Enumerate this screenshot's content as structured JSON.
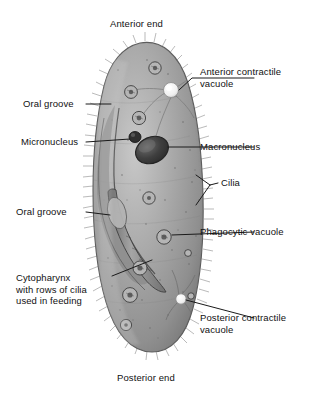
{
  "figure": {
    "organism": "Paramecium",
    "view": "whole-cell light micrograph style illustration",
    "background_color": "#ffffff",
    "body_color": "#9a9a9a",
    "body_highlight_color": "#c3c3c3",
    "body_shadow_color": "#6f6f6f",
    "outline_color": "#4a4a4a",
    "nucleus_color": "#3b3b3b",
    "vacuole_color": "#f4f4f4",
    "leader_color": "#1a1a1a",
    "text_color": "#111111"
  },
  "labels": {
    "anterior_end": "Anterior end",
    "posterior_end": "Posterior end",
    "anterior_contractile_vacuole": "Anterior contractile\nvacuole",
    "macronucleus": "Macronucleus",
    "cilia": "Cilia",
    "phagocytic_vacuole": "Phagocytic vacuole",
    "posterior_contractile_vacuole": "Posterior contractile\nvacuole",
    "oral_groove_upper": "Oral groove",
    "micronucleus": "Micronucleus",
    "oral_groove_lower": "Oral groove",
    "cytopharynx": "Cytopharynx\nwith rows of cilia\nused in feeding"
  },
  "structures": [
    {
      "name": "anterior contractile vacuole",
      "side": "right",
      "shape": "star-shaped clear vacuole with radiating canals"
    },
    {
      "name": "macronucleus",
      "side": "right",
      "shape": "large dark oval"
    },
    {
      "name": "micronucleus",
      "side": "left",
      "shape": "small dark circle beside macronucleus"
    },
    {
      "name": "cilia",
      "side": "right",
      "shape": "hair-like fringe around entire cell margin"
    },
    {
      "name": "phagocytic vacuole",
      "side": "right",
      "shape": "small round food vacuoles in cytoplasm"
    },
    {
      "name": "posterior contractile vacuole",
      "side": "right",
      "shape": "clear vacuole with radiating canals near posterior"
    },
    {
      "name": "oral groove",
      "side": "left",
      "shape": "depressed furrow along one side"
    },
    {
      "name": "cytopharynx",
      "side": "left",
      "shape": "tapering channel lined with cilia leading inward"
    }
  ]
}
